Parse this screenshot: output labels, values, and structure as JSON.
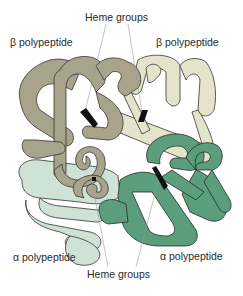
{
  "figure": {
    "labels": {
      "heme_top": "Heme groups",
      "beta_left": "β polypeptide",
      "beta_right": "β polypeptide",
      "alpha_left": "α polypeptide",
      "alpha_right": "α polypeptide",
      "heme_bottom": "Heme groups"
    },
    "colors": {
      "beta_left": "#a8a48c",
      "beta_right": "#e4e4cc",
      "alpha_left": "#cfe2d6",
      "alpha_right": "#5a9e7c",
      "outline": "#333333",
      "heme": "#111111",
      "leader_line": "#9a9a9a"
    },
    "subunits": [
      {
        "name": "beta-left",
        "type": "β polypeptide"
      },
      {
        "name": "beta-right",
        "type": "β polypeptide"
      },
      {
        "name": "alpha-left",
        "type": "α polypeptide"
      },
      {
        "name": "alpha-right",
        "type": "α polypeptide"
      }
    ],
    "heme_count": 4
  }
}
